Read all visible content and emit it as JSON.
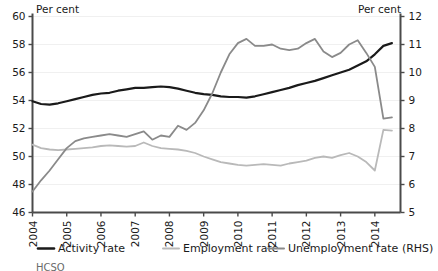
{
  "chart_data": {
    "type": "line",
    "title": "",
    "xlabel": "",
    "ylabel_left": "Per cent",
    "ylabel_right": "Per cent",
    "left_axis_label": "Per cent",
    "right_axis_label": "Per cent",
    "ylim": [
      46,
      60
    ],
    "ylim_right": [
      5,
      12
    ],
    "yticks": [
      46,
      48,
      50,
      52,
      54,
      56,
      58,
      60
    ],
    "yticks_right": [
      5,
      6,
      7,
      8,
      9,
      10,
      11,
      12
    ],
    "xlim": [
      2004,
      2014.75
    ],
    "xticks": [
      2004,
      2005,
      2006,
      2007,
      2008,
      2009,
      2010,
      2011,
      2012,
      2013,
      2014
    ],
    "xtick_labels": [
      "2004",
      "2005",
      "2006",
      "2007",
      "2008",
      "2009",
      "2010",
      "2011",
      "2012",
      "2013",
      "2014"
    ],
    "grid": true,
    "legend_position": "bottom",
    "colors": {
      "activity": "#1a1a1a",
      "employment": "#b9b9b9",
      "unemployment": "#8a8a8a",
      "grid": "#f0f0f0",
      "axis": "#4a4a4a",
      "background": "#ffffff"
    },
    "series": [
      {
        "name": "Activity rate",
        "axis": "left",
        "color": "#1a1a1a",
        "x": [
          2004.0,
          2004.25,
          2004.5,
          2004.75,
          2005.0,
          2005.25,
          2005.5,
          2005.75,
          2006.0,
          2006.25,
          2006.5,
          2006.75,
          2007.0,
          2007.25,
          2007.5,
          2007.75,
          2008.0,
          2008.25,
          2008.5,
          2008.75,
          2009.0,
          2009.25,
          2009.5,
          2009.75,
          2010.0,
          2010.25,
          2010.5,
          2010.75,
          2011.0,
          2011.25,
          2011.5,
          2011.75,
          2012.0,
          2012.25,
          2012.5,
          2012.75,
          2013.0,
          2013.25,
          2013.5,
          2013.75,
          2014.0,
          2014.25,
          2014.5
        ],
        "y": [
          53.95,
          53.75,
          53.7,
          53.8,
          53.95,
          54.1,
          54.25,
          54.4,
          54.5,
          54.55,
          54.7,
          54.8,
          54.9,
          54.9,
          54.95,
          55.0,
          54.95,
          54.85,
          54.7,
          54.55,
          54.45,
          54.4,
          54.3,
          54.25,
          54.25,
          54.2,
          54.3,
          54.45,
          54.6,
          54.75,
          54.9,
          55.1,
          55.25,
          55.4,
          55.6,
          55.8,
          56.0,
          56.2,
          56.5,
          56.8,
          57.3,
          57.9,
          58.1
        ]
      },
      {
        "name": "Employment rate",
        "axis": "left",
        "color": "#b9b9b9",
        "x": [
          2004.0,
          2004.25,
          2004.5,
          2004.75,
          2005.0,
          2005.25,
          2005.5,
          2005.75,
          2006.0,
          2006.25,
          2006.5,
          2006.75,
          2007.0,
          2007.25,
          2007.5,
          2007.75,
          2008.0,
          2008.25,
          2008.5,
          2008.75,
          2009.0,
          2009.25,
          2009.5,
          2009.75,
          2010.0,
          2010.25,
          2010.5,
          2010.75,
          2011.0,
          2011.25,
          2011.5,
          2011.75,
          2012.0,
          2012.25,
          2012.5,
          2012.75,
          2013.0,
          2013.25,
          2013.5,
          2013.75,
          2014.0,
          2014.25,
          2014.5
        ],
        "y": [
          50.85,
          50.6,
          50.5,
          50.45,
          50.5,
          50.55,
          50.6,
          50.65,
          50.75,
          50.8,
          50.75,
          50.7,
          50.75,
          51.0,
          50.75,
          50.6,
          50.55,
          50.5,
          50.4,
          50.25,
          50.0,
          49.8,
          49.6,
          49.5,
          49.4,
          49.35,
          49.4,
          49.45,
          49.4,
          49.35,
          49.5,
          49.6,
          49.7,
          49.9,
          50.0,
          49.9,
          50.1,
          50.25,
          50.0,
          49.6,
          49.0,
          51.9,
          51.85
        ]
      },
      {
        "name": "Unemployment rate (RHS)",
        "axis": "right",
        "color": "#8a8a8a",
        "x": [
          2004.0,
          2004.25,
          2004.5,
          2004.75,
          2005.0,
          2005.25,
          2005.5,
          2005.75,
          2006.0,
          2006.25,
          2006.5,
          2006.75,
          2007.0,
          2007.25,
          2007.5,
          2007.75,
          2008.0,
          2008.25,
          2008.5,
          2008.75,
          2009.0,
          2009.25,
          2009.5,
          2009.75,
          2010.0,
          2010.25,
          2010.5,
          2010.75,
          2011.0,
          2011.25,
          2011.5,
          2011.75,
          2012.0,
          2012.25,
          2012.5,
          2012.75,
          2013.0,
          2013.25,
          2013.5,
          2013.75,
          2014.0,
          2014.25,
          2014.5
        ],
        "y": [
          5.75,
          6.15,
          6.5,
          6.9,
          7.3,
          7.55,
          7.65,
          7.7,
          7.75,
          7.8,
          7.75,
          7.7,
          7.8,
          7.9,
          7.6,
          7.75,
          7.7,
          8.1,
          7.95,
          8.2,
          8.65,
          9.25,
          10.0,
          10.65,
          11.05,
          11.2,
          10.95,
          10.95,
          11.0,
          10.85,
          10.8,
          10.85,
          11.05,
          11.2,
          10.75,
          10.55,
          10.7,
          11.0,
          11.15,
          10.7,
          10.2,
          8.35,
          8.4
        ]
      }
    ]
  },
  "legend": {
    "items": [
      {
        "label": "Activity rate",
        "color": "#1a1a1a"
      },
      {
        "label": "Employment rate",
        "color": "#b9b9b9"
      },
      {
        "label": "Unemployment rate (RHS)",
        "color": "#8a8a8a"
      }
    ]
  },
  "footnote": {
    "text": "HCSO"
  }
}
